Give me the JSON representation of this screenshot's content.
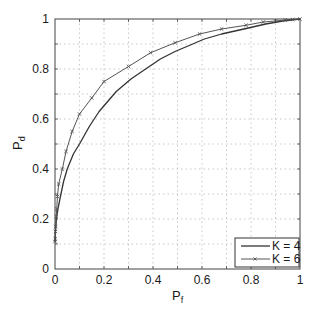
{
  "chart_data": {
    "type": "line",
    "title": "",
    "xlabel": "P_f",
    "ylabel": "P_d",
    "xlabel_main": "P",
    "xlabel_sub": "f",
    "ylabel_main": "P",
    "ylabel_sub": "d",
    "xlim": [
      0,
      1
    ],
    "ylim": [
      0,
      1
    ],
    "grid": true,
    "legend_position": "lower right",
    "x_ticks": [
      "0",
      "0.2",
      "0.4",
      "0.6",
      "0.8",
      "1"
    ],
    "y_ticks": [
      "0",
      "0.2",
      "0.4",
      "0.6",
      "0.8",
      "1"
    ],
    "series": [
      {
        "name": "K = 4",
        "marker": "none",
        "color": "#333333",
        "x": [
          0.0,
          0.002,
          0.005,
          0.01,
          0.02,
          0.035,
          0.05,
          0.075,
          0.1,
          0.14,
          0.18,
          0.25,
          0.31,
          0.37,
          0.43,
          0.49,
          0.55,
          0.61,
          0.68,
          0.78,
          0.86,
          0.93,
          1.0
        ],
        "y": [
          0.11,
          0.15,
          0.19,
          0.23,
          0.28,
          0.35,
          0.4,
          0.46,
          0.5,
          0.57,
          0.63,
          0.71,
          0.76,
          0.8,
          0.84,
          0.87,
          0.895,
          0.92,
          0.94,
          0.962,
          0.98,
          0.992,
          1.0
        ]
      },
      {
        "name": "K = 6",
        "marker": "x",
        "color": "#555555",
        "x": [
          0.0,
          0.001,
          0.002,
          0.003,
          0.005,
          0.007,
          0.01,
          0.015,
          0.03,
          0.045,
          0.07,
          0.1,
          0.15,
          0.2,
          0.3,
          0.39,
          0.49,
          0.59,
          0.68,
          0.78,
          0.85,
          0.9,
          0.94,
          0.97,
          1.0
        ],
        "y": [
          0.11,
          0.12,
          0.15,
          0.17,
          0.21,
          0.24,
          0.29,
          0.34,
          0.4,
          0.47,
          0.55,
          0.62,
          0.684,
          0.75,
          0.81,
          0.865,
          0.905,
          0.94,
          0.96,
          0.975,
          0.988,
          0.992,
          0.996,
          0.998,
          1.0
        ]
      }
    ]
  },
  "legend": {
    "items": [
      "K = 4",
      "K = 6"
    ]
  }
}
